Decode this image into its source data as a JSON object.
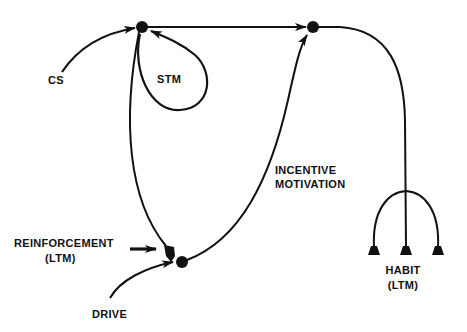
{
  "diagram": {
    "type": "neural-network-schematic",
    "colors": {
      "ink": "#111111",
      "background": "#ffffff"
    },
    "labels": {
      "cs": "CS",
      "stm": "STM",
      "incentive_line1": "INCENTIVE",
      "incentive_line2": "MOTIVATION",
      "reinforcement_line1": "REINFORCEMENT",
      "reinforcement_line2": "(LTM)",
      "drive": "DRIVE",
      "habit_line1": "HABIT",
      "habit_line2": "(LTM)"
    },
    "nodes": [
      {
        "id": "sensory-node",
        "x": 142,
        "y": 27
      },
      {
        "id": "motor-node",
        "x": 313,
        "y": 27
      },
      {
        "id": "drive-node",
        "x": 182,
        "y": 261
      }
    ],
    "connections": [
      {
        "from": "CS",
        "to": "sensory-node",
        "label": "CS"
      },
      {
        "from": "sensory-node",
        "to": "sensory-node",
        "label": "STM"
      },
      {
        "from": "sensory-node",
        "to": "motor-node"
      },
      {
        "from": "sensory-node",
        "to": "drive-node",
        "label": "REINFORCEMENT (LTM)"
      },
      {
        "from": "DRIVE",
        "to": "drive-node",
        "label": "DRIVE"
      },
      {
        "from": "drive-node",
        "to": "motor-node",
        "label": "INCENTIVE MOTIVATION"
      },
      {
        "from": "motor-node",
        "to": "habit-synapses",
        "label": "HABIT (LTM)"
      }
    ]
  }
}
